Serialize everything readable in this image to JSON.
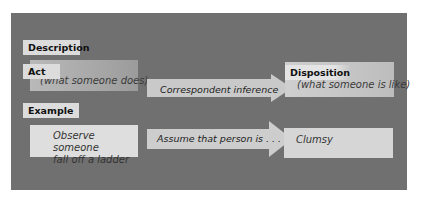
{
  "colors": {
    "panel_bg": "#707070",
    "label_bg": "#dcdcdc",
    "box_light": "#dedede",
    "arrow_fill": "#c8c8c8",
    "text_dark": "#111111",
    "text_italic": "#333333"
  },
  "diagram": {
    "title_section": "Description",
    "example_section": "Example",
    "description_row": {
      "left_box": {
        "label": "Act",
        "text": "(what someone does)"
      },
      "arrow": {
        "text": "Correspondent inference"
      },
      "right_box": {
        "label": "Disposition",
        "text": "(what someone is like)"
      }
    },
    "example_row": {
      "left_box": {
        "line1": "Observe someone",
        "line2": "fall off a ladder"
      },
      "arrow": {
        "text": "Assume that person is . . ."
      },
      "right_box": {
        "text": "Clumsy"
      }
    }
  }
}
